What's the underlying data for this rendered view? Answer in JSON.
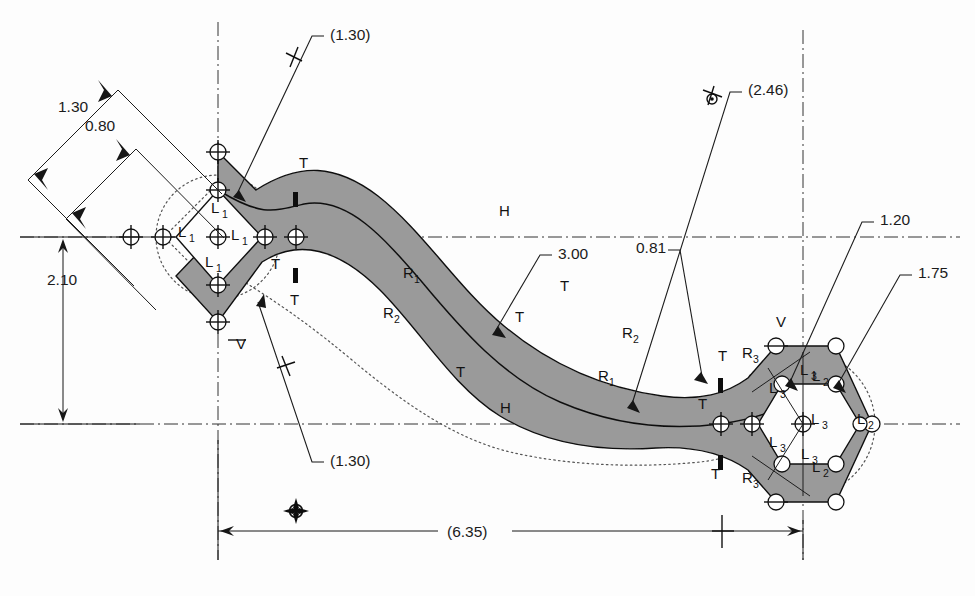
{
  "drawing": {
    "title": "Parametric sketch with dimensions and geometric constraints",
    "background_color": "#fdfdfd",
    "fill_color": "#9a9a9a",
    "line_color": "#111111",
    "width": 975,
    "height": 596
  },
  "dimensions": [
    {
      "id": "d-130-upper-left",
      "label": "1.30",
      "kind": "linear",
      "driving": true,
      "x": 58,
      "y": 112
    },
    {
      "id": "d-080-upper-left",
      "label": "0.80",
      "kind": "linear",
      "driving": true,
      "x": 85,
      "y": 131
    },
    {
      "id": "d-130-top",
      "label": "(1.30)",
      "kind": "reference",
      "driving": false,
      "x": 330,
      "y": 40
    },
    {
      "id": "d-130-bottom",
      "label": "(1.30)",
      "kind": "reference",
      "driving": false,
      "x": 330,
      "y": 466
    },
    {
      "id": "d-210-left",
      "label": "2.10",
      "kind": "linear",
      "driving": true,
      "x": 47,
      "y": 285
    },
    {
      "id": "d-300-mid",
      "label": "3.00",
      "kind": "linear",
      "driving": true,
      "x": 558,
      "y": 259
    },
    {
      "id": "d-081",
      "label": "0.81",
      "kind": "linear",
      "driving": true,
      "x": 636,
      "y": 253
    },
    {
      "id": "d-246",
      "label": "(2.46)",
      "kind": "reference",
      "driving": false,
      "x": 748,
      "y": 95
    },
    {
      "id": "d-120",
      "label": "1.20",
      "kind": "linear",
      "driving": true,
      "x": 880,
      "y": 225
    },
    {
      "id": "d-175",
      "label": "1.75",
      "kind": "linear",
      "driving": true,
      "x": 918,
      "y": 278
    },
    {
      "id": "d-635-bottom",
      "label": "(6.35)",
      "kind": "reference",
      "driving": false,
      "x": 472,
      "y": 554
    }
  ],
  "constraints": [
    {
      "id": "c-T-1",
      "symbol": "T",
      "meaning": "tangent",
      "x": 299,
      "y": 168
    },
    {
      "id": "c-T-2",
      "symbol": "T",
      "meaning": "tangent",
      "x": 290,
      "y": 305
    },
    {
      "id": "c-T-3",
      "symbol": "T",
      "meaning": "tangent",
      "x": 271,
      "y": 269
    },
    {
      "id": "c-T-4",
      "symbol": "T",
      "meaning": "tangent",
      "x": 515,
      "y": 322
    },
    {
      "id": "c-T-5",
      "symbol": "T",
      "meaning": "tangent",
      "x": 560,
      "y": 291
    },
    {
      "id": "c-T-6",
      "symbol": "T",
      "meaning": "tangent",
      "x": 456,
      "y": 377
    },
    {
      "id": "c-T-7",
      "symbol": "T",
      "meaning": "tangent",
      "x": 698,
      "y": 409
    },
    {
      "id": "c-T-8",
      "symbol": "T",
      "meaning": "tangent",
      "x": 718,
      "y": 361
    },
    {
      "id": "c-T-9",
      "symbol": "T",
      "meaning": "tangent",
      "x": 711,
      "y": 479
    },
    {
      "id": "c-H-1",
      "symbol": "H",
      "meaning": "horizontal",
      "x": 499,
      "y": 216
    },
    {
      "id": "c-H-2",
      "symbol": "H",
      "meaning": "horizontal",
      "x": 500,
      "y": 413
    },
    {
      "id": "c-V-1",
      "symbol": "V",
      "meaning": "vertical",
      "x": 236,
      "y": 349
    },
    {
      "id": "c-V-2",
      "symbol": "V",
      "meaning": "vertical",
      "x": 776,
      "y": 327
    },
    {
      "id": "c-R1-1",
      "symbol": "R",
      "sub": "1",
      "meaning": "equal-radius",
      "x": 403,
      "y": 278
    },
    {
      "id": "c-R1-2",
      "symbol": "R",
      "sub": "1",
      "meaning": "equal-radius",
      "x": 598,
      "y": 381
    },
    {
      "id": "c-R2-1",
      "symbol": "R",
      "sub": "2",
      "meaning": "equal-radius",
      "x": 383,
      "y": 318
    },
    {
      "id": "c-R2-2",
      "symbol": "R",
      "sub": "2",
      "meaning": "equal-radius",
      "x": 622,
      "y": 338
    },
    {
      "id": "c-R3-1",
      "symbol": "R",
      "sub": "3",
      "meaning": "equal-radius",
      "x": 742,
      "y": 358
    },
    {
      "id": "c-R3-2",
      "symbol": "R",
      "sub": "3",
      "meaning": "equal-radius",
      "x": 742,
      "y": 483
    },
    {
      "id": "c-L1-a",
      "symbol": "L",
      "sub": "1",
      "meaning": "equal-length",
      "x": 211,
      "y": 213
    },
    {
      "id": "c-L1-b",
      "symbol": "L",
      "sub": "1",
      "meaning": "equal-length",
      "x": 231,
      "y": 240
    },
    {
      "id": "c-L1-c",
      "symbol": "L",
      "sub": "1",
      "meaning": "equal-length",
      "x": 205,
      "y": 267
    },
    {
      "id": "c-L1-d",
      "symbol": "L",
      "sub": "1",
      "meaning": "equal-length",
      "x": 178,
      "y": 237
    },
    {
      "id": "c-L3-a",
      "symbol": "L",
      "sub": "3",
      "meaning": "equal-length",
      "x": 769,
      "y": 393
    },
    {
      "id": "c-L3-b",
      "symbol": "L",
      "sub": "3",
      "meaning": "equal-length",
      "x": 769,
      "y": 447
    },
    {
      "id": "c-L3-c",
      "symbol": "L",
      "sub": "3",
      "meaning": "equal-length",
      "x": 811,
      "y": 424
    },
    {
      "id": "c-L3-d",
      "symbol": "L",
      "sub": "3",
      "meaning": "equal-length",
      "x": 800,
      "y": 375
    },
    {
      "id": "c-L3-e",
      "symbol": "L",
      "sub": "3",
      "meaning": "equal-length",
      "x": 801,
      "y": 459
    },
    {
      "id": "c-L2-a",
      "symbol": "L",
      "sub": "2",
      "meaning": "equal-length",
      "x": 857,
      "y": 424
    },
    {
      "id": "c-L2-b",
      "symbol": "L",
      "sub": "2",
      "meaning": "equal-length",
      "x": 812,
      "y": 381
    },
    {
      "id": "c-L2-c",
      "symbol": "L",
      "sub": "2",
      "meaning": "equal-length",
      "x": 812,
      "y": 472
    }
  ],
  "geometry": {
    "left_feature": "diamond",
    "right_feature": "hexagon",
    "spine": "s-curve-band",
    "origin_marker": {
      "x": 296,
      "y": 511
    }
  }
}
